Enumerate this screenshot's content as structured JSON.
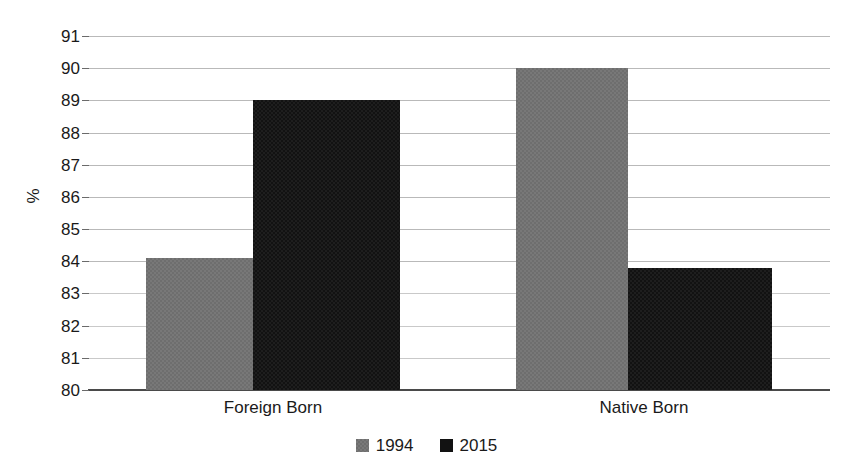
{
  "chart_data": {
    "type": "bar",
    "title": "",
    "subtitle": "",
    "xlabel": "",
    "ylabel": "%",
    "ylim": [
      80,
      91
    ],
    "ytick_step": 1,
    "yticks": [
      91,
      90,
      89,
      88,
      87,
      86,
      85,
      84,
      83,
      82,
      81,
      80
    ],
    "grid": true,
    "grid_axis": "y",
    "legend_position": "bottom-center",
    "categories": [
      "Foreign Born",
      "Native Born"
    ],
    "series": [
      {
        "name": "1994",
        "color": "#6e6e6e",
        "values": [
          84.1,
          90.0
        ]
      },
      {
        "name": "2015",
        "color": "#121212",
        "values": [
          89.0,
          83.8
        ]
      }
    ]
  }
}
